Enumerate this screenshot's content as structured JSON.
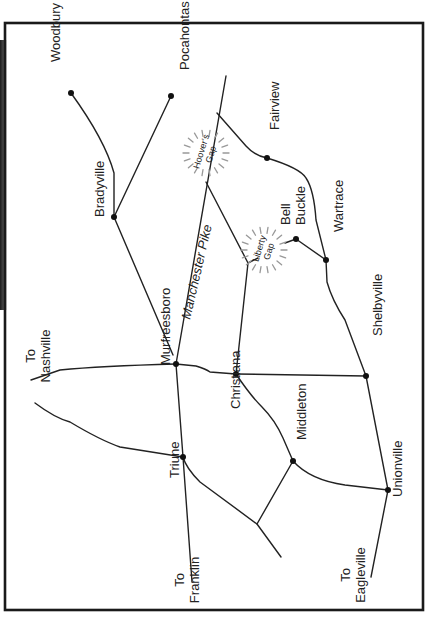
{
  "map": {
    "orientation": "rotated-90-ccw",
    "colors": {
      "ink": "#222222",
      "frame": "#1a1a1a",
      "burst": "#999999",
      "background": "#ffffff"
    },
    "frame": {
      "x": 5,
      "y": 23,
      "width": 418,
      "height": 587
    },
    "towns": [
      {
        "id": "woodbury",
        "label": "Woodbury",
        "x": 71,
        "y": 93,
        "label_x": 60,
        "label_y": 62
      },
      {
        "id": "pocahontas",
        "label": "Pocahontas",
        "x": 171,
        "y": 96,
        "label_x": 189,
        "label_y": 70
      },
      {
        "id": "bradyville",
        "label": "Bradyville",
        "x": 114,
        "y": 217,
        "label_x": 104,
        "label_y": 217
      },
      {
        "id": "fairview",
        "label": "Fairview",
        "x": 267,
        "y": 158,
        "label_x": 279,
        "label_y": 130
      },
      {
        "id": "bell-buckle",
        "label_line1": "Bell",
        "label_line2": "Buckle",
        "x": 296,
        "y": 239,
        "label_x": 290,
        "label_y": 225
      },
      {
        "id": "wartrace",
        "label": "Wartrace",
        "x": 326,
        "y": 260,
        "label_x": 343,
        "label_y": 232
      },
      {
        "id": "murfreesboro",
        "label": "Murfreesboro",
        "x": 176,
        "y": 364,
        "label_x": 170,
        "label_y": 365
      },
      {
        "id": "christiana",
        "label": "Christiana",
        "x": 236,
        "y": 374,
        "label_x": 240,
        "label_y": 409
      },
      {
        "id": "shelbyville",
        "label": "Shelbyville",
        "x": 366,
        "y": 376,
        "label_x": 382,
        "label_y": 336
      },
      {
        "id": "triune",
        "label": "Triune",
        "x": 183,
        "y": 457,
        "label_x": 179,
        "label_y": 478
      },
      {
        "id": "middleton",
        "label": "Middleton",
        "x": 293,
        "y": 461,
        "label_x": 306,
        "label_y": 440
      },
      {
        "id": "unionville",
        "label": "Unionville",
        "x": 388,
        "y": 490,
        "label_x": 402,
        "label_y": 497
      }
    ],
    "directions": [
      {
        "id": "to-nashville",
        "line1": "To",
        "line2": "Nashville",
        "x": 35,
        "y": 356
      },
      {
        "id": "to-franklin",
        "line1": "To",
        "line2": "Franklin",
        "x": 184,
        "y": 580
      },
      {
        "id": "to-eagleville",
        "line1": "To",
        "line2": "Eagleville",
        "x": 350,
        "y": 575
      }
    ],
    "road_labels": [
      {
        "id": "manchester-pike",
        "label": "Manchester Pike",
        "x": 190,
        "y": 320,
        "angle": -77
      }
    ],
    "gaps": [
      {
        "id": "hoovers-gap",
        "line1": "Hoover's",
        "line2": "Gap",
        "cx": 206,
        "cy": 153,
        "angle": -73
      },
      {
        "id": "liberty-gap",
        "line1": "Liberty",
        "line2": "Gap",
        "cx": 264,
        "cy": 250,
        "angle": -73
      }
    ],
    "roads": [
      {
        "id": "manchester-pike-road",
        "d": "M226,76 L176,364 L183,457 L192,582"
      },
      {
        "id": "woodbury-bradyville",
        "d": "M71,93 Q105,140 114,173 L114,217"
      },
      {
        "id": "pocahontas-bradyville",
        "d": "M171,96 L114,217"
      },
      {
        "id": "bradyville-murfreesboro",
        "d": "M114,217 L173,355"
      },
      {
        "id": "hoovers-fairview-wartrace",
        "d": "M217,113 L246,146 Q255,156 267,158 Q300,168 306,178 Q314,190 316,220 L326,260"
      },
      {
        "id": "hoovers-liberty",
        "d": "M206,182 L248,263 L258,258"
      },
      {
        "id": "liberty-christiana",
        "d": "M248,263 L236,374"
      },
      {
        "id": "libgap-bellbuckle",
        "d": "M285,243 L296,239 L326,260"
      },
      {
        "id": "wartrace-shelbyville",
        "d": "M326,260 L327,282 Q332,300 345,320 L366,376"
      },
      {
        "id": "murfreesboro-christiana",
        "d": "M176,364 L196,366 Q206,369 210,372 L236,374"
      },
      {
        "id": "christiana-shelbyville",
        "d": "M236,374 L366,376"
      },
      {
        "id": "shelbyville-unionville",
        "d": "M366,376 L388,490"
      },
      {
        "id": "unionville-eagleville",
        "d": "M388,490 L371,577"
      },
      {
        "id": "christiana-middleton",
        "d": "M236,374 Q250,395 262,407 Q275,420 283,438 L293,461"
      },
      {
        "id": "middleton-unionville",
        "d": "M293,461 Q310,480 345,485 L388,490"
      },
      {
        "id": "middleton-junction",
        "d": "M293,461 L257,524"
      },
      {
        "id": "triune-southeast",
        "d": "M183,457 Q186,468 200,482 L257,524 L281,557"
      },
      {
        "id": "to-nashville-road-a",
        "d": "M31,380 L60,370 Q100,366 176,364"
      },
      {
        "id": "to-nashville-road-b",
        "d": "M35,403 Q55,418 70,422 Q100,440 120,447 L183,457"
      }
    ]
  }
}
